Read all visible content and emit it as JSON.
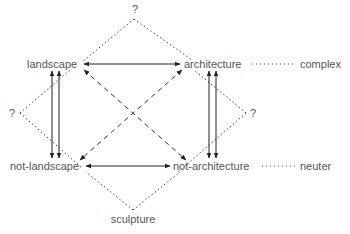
{
  "diagram": {
    "nodes": {
      "landscape": "landscape",
      "architecture": "architecture",
      "not_landscape": "not-landscape",
      "not_architecture": "not-architecture",
      "complex": "complex",
      "neuter": "neuter",
      "sculpture": "sculpture",
      "top_unknown": "?",
      "left_unknown": "?",
      "right_unknown": "?"
    },
    "colors": {
      "text": "#555555",
      "solid_line": "#222222",
      "dashed_line": "#333333",
      "dotted_line": "#444444"
    }
  }
}
